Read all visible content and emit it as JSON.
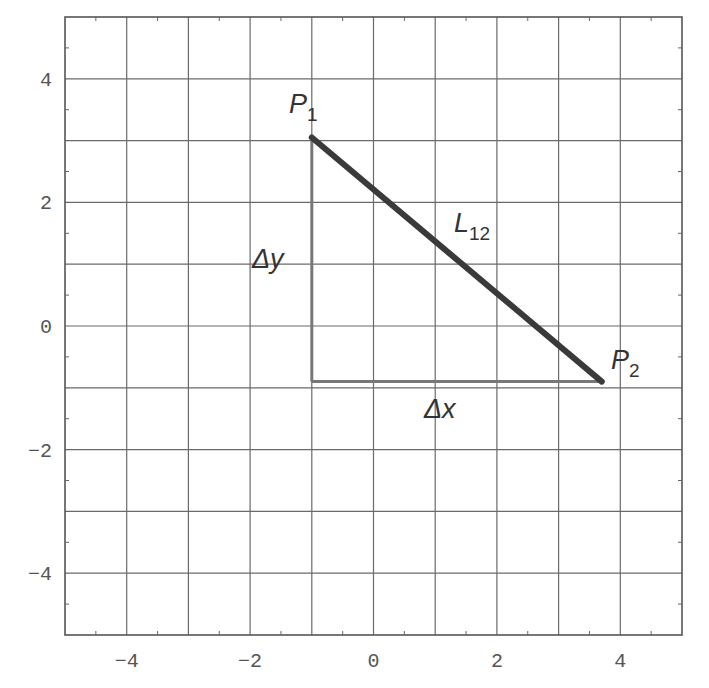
{
  "chart_data": {
    "type": "line",
    "title": "",
    "xlabel": "",
    "ylabel": "",
    "xlim": [
      -5,
      5
    ],
    "ylim": [
      -5,
      5
    ],
    "grid": true,
    "x_ticks": [
      "-4",
      "-2",
      "0",
      "2",
      "4"
    ],
    "y_ticks": [
      "4",
      "2",
      "0",
      "-2",
      "-4"
    ],
    "points": {
      "P1": {
        "x": -1.0,
        "y": 3.05
      },
      "P2": {
        "x": 3.7,
        "y": -0.9
      },
      "corner": {
        "x": -1.0,
        "y": -0.9
      }
    },
    "series": [
      {
        "name": "L12",
        "x": [
          -1.0,
          3.7
        ],
        "y": [
          3.05,
          -0.9
        ],
        "style": "thick dark"
      },
      {
        "name": "Δy",
        "x": [
          -1.0,
          -1.0
        ],
        "y": [
          3.05,
          -0.9
        ],
        "style": "medium gray"
      },
      {
        "name": "Δx",
        "x": [
          -1.0,
          3.7
        ],
        "y": [
          -0.9,
          -0.9
        ],
        "style": "medium gray"
      }
    ],
    "annotations": [
      {
        "text": "P",
        "sub": "1",
        "near": "P1"
      },
      {
        "text": "P",
        "sub": "2",
        "near": "P2"
      },
      {
        "text": "L",
        "sub": "12",
        "near": "midpoint of L12"
      },
      {
        "text": "Δy",
        "near": "vertical leg"
      },
      {
        "text": "Δx",
        "near": "horizontal leg"
      }
    ]
  },
  "labels": {
    "p1": "P",
    "p1_sub": "1",
    "p2": "P",
    "p2_sub": "2",
    "l12": "L",
    "l12_sub": "12",
    "dy": "Δy",
    "dx": "Δx"
  },
  "colors": {
    "grid": "#6a6a6a",
    "hypotenuse": "#3a3a3a",
    "legs": "#777777",
    "text": "#333333"
  }
}
